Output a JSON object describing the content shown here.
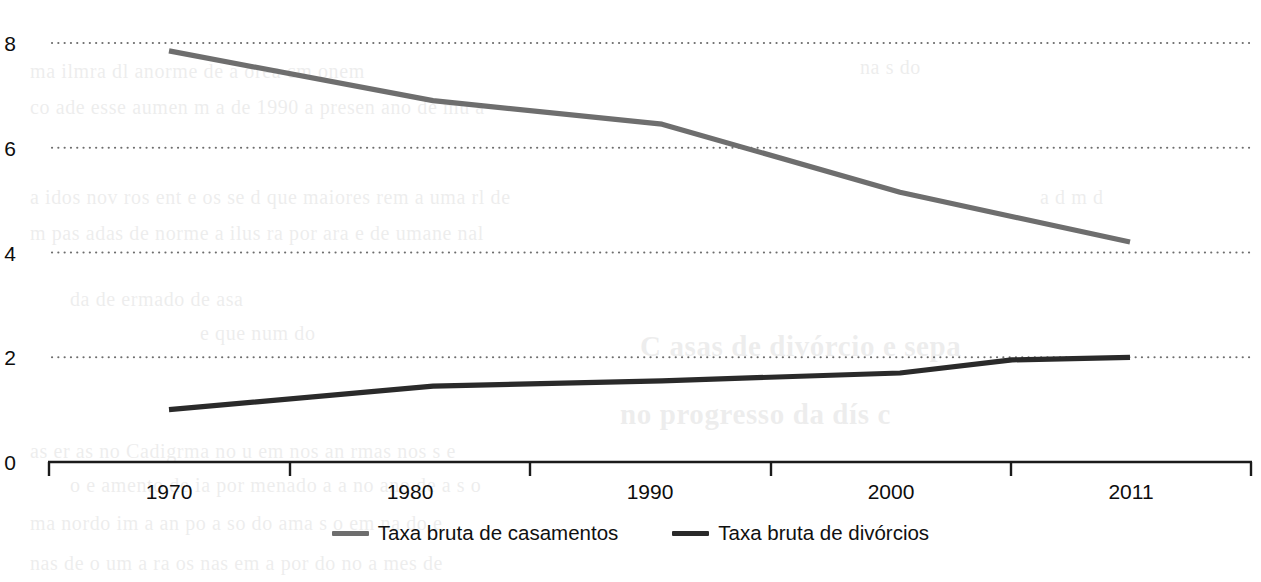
{
  "chart_data": {
    "type": "line",
    "title": "",
    "subtitle": "",
    "xlabel": "",
    "ylabel": "",
    "categories": [
      "1970",
      "1980",
      "1990",
      "2000",
      "2011"
    ],
    "x_tick_labels": [
      "1970",
      "1980",
      "1990",
      "2000",
      "2011"
    ],
    "y_tick_labels": [
      "8",
      "6",
      "4",
      "2",
      "0"
    ],
    "y_ticks": [
      8,
      6,
      4,
      2,
      0
    ],
    "ylim": [
      0,
      8
    ],
    "xlim_labels": [
      "1970",
      "2011"
    ],
    "grid": "horizontal-dotted",
    "legend_position": "bottom-center",
    "series": [
      {
        "name": "Taxa bruta de casamentos",
        "color": "#6e6e6e",
        "values": [
          7.85,
          6.9,
          6.45,
          5.15,
          4.2
        ],
        "points": [
          {
            "x": "1970",
            "y": 7.85
          },
          {
            "x": "1981",
            "y": 6.9
          },
          {
            "x": "1990",
            "y": 6.45
          },
          {
            "x": "2000",
            "y": 5.15
          },
          {
            "x": "2011",
            "y": 4.2
          }
        ]
      },
      {
        "name": "Taxa bruta de divórcios",
        "color": "#2a2a2a",
        "values": [
          1.0,
          1.45,
          1.55,
          1.7,
          2.0
        ],
        "points": [
          {
            "x": "1970",
            "y": 1.0
          },
          {
            "x": "1981",
            "y": 1.45
          },
          {
            "x": "1990",
            "y": 1.55
          },
          {
            "x": "2000",
            "y": 1.7
          },
          {
            "x": "2005",
            "y": 1.95
          },
          {
            "x": "2011",
            "y": 2.0
          }
        ]
      }
    ]
  },
  "axis": {
    "y": {
      "t0": "8",
      "t1": "6",
      "t2": "4",
      "t3": "2",
      "t4": "0"
    },
    "x": {
      "t0": "1970",
      "t1": "1980",
      "t2": "1990",
      "t3": "2000",
      "t4": "2011"
    }
  },
  "legend": {
    "items": [
      {
        "label": "Taxa bruta de casamentos",
        "color": "#6e6e6e"
      },
      {
        "label": "Taxa bruta de divórcios",
        "color": "#2a2a2a"
      }
    ]
  },
  "colors": {
    "marriage_line": "#6e6e6e",
    "divorce_line": "#2a2a2a",
    "gridline": "#6d6d6d",
    "axis": "#1b1b1b",
    "background": "#ffffff"
  }
}
